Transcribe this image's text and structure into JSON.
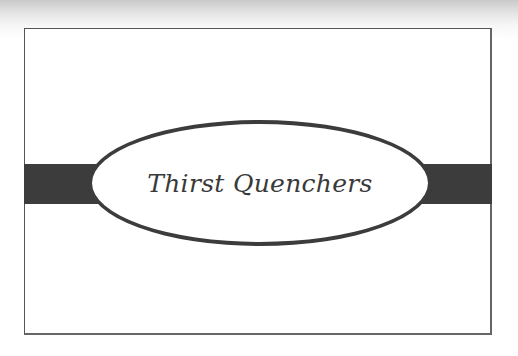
{
  "card": {
    "title": "Thirst Quenchers"
  },
  "colors": {
    "band": "#3c3c3c",
    "border": "#555555",
    "text": "#3a3a3a",
    "background": "#ffffff"
  }
}
